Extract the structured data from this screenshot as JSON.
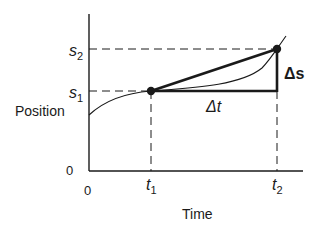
{
  "diagram": {
    "type": "position-time graph",
    "axes": {
      "y_label": "Position",
      "x_label": "Time",
      "y_origin_label": "0",
      "x_origin_label": "0"
    },
    "ticks": {
      "s1": {
        "base": "s",
        "sub": "1"
      },
      "s2": {
        "base": "s",
        "sub": "2"
      },
      "t1": {
        "base": "t",
        "sub": "1"
      },
      "t2": {
        "base": "t",
        "sub": "2"
      }
    },
    "annotations": {
      "delta_s": "Δs",
      "delta_t": "Δt"
    },
    "points": [
      {
        "name": "P1",
        "t": "t1",
        "s": "s1"
      },
      {
        "name": "P2",
        "t": "t2",
        "s": "s2"
      }
    ],
    "colors": {
      "ink": "#1a1a1a",
      "background": "#ffffff"
    }
  }
}
